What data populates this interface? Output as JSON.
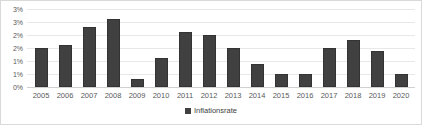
{
  "chart_data": {
    "type": "bar",
    "title": "",
    "xlabel": "",
    "ylabel": "",
    "ylim": [
      0,
      3
    ],
    "grid": true,
    "legend_position": "bottom",
    "categories": [
      "2005",
      "2006",
      "2007",
      "2008",
      "2009",
      "2010",
      "2011",
      "2012",
      "2013",
      "2014",
      "2015",
      "2016",
      "2017",
      "2018",
      "2019",
      "2020"
    ],
    "series": [
      {
        "name": "Inflationsrate",
        "color": "#404040",
        "values": [
          1.5,
          1.6,
          2.3,
          2.6,
          0.3,
          1.1,
          2.1,
          2.0,
          1.5,
          0.9,
          0.5,
          0.5,
          1.5,
          1.8,
          1.4,
          0.5
        ]
      }
    ],
    "ytick_values": [
      3.0,
      2.5,
      2.0,
      1.5,
      1.0,
      0.5,
      0.0
    ],
    "ytick_labels": [
      "3%",
      "3%",
      "2%",
      "2%",
      "1%",
      "1%",
      "0%"
    ]
  },
  "legend": {
    "entries": [
      {
        "label": "Inflationsrate",
        "color": "#404040"
      }
    ]
  },
  "colors": {
    "bar": "#404040",
    "bar_border": "#333333",
    "gridline": "#e8e8e8",
    "axis_text": "#595959",
    "frame_border": "#d9d9d9",
    "background": "#ffffff"
  }
}
